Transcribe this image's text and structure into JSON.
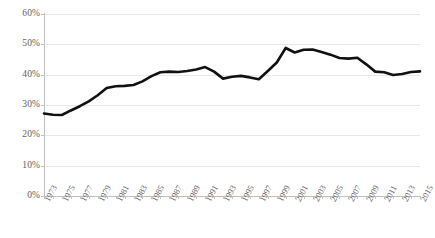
{
  "chart_data": {
    "type": "line",
    "title": "",
    "subtitle": "",
    "xlabel": "",
    "ylabel": "",
    "ylim": [
      0,
      60
    ],
    "xlim": [
      1973,
      2015
    ],
    "y_tick_labels": [
      "0%",
      "10%",
      "20%",
      "30%",
      "40%",
      "50%",
      "60%"
    ],
    "y_tick_values": [
      0,
      10,
      20,
      30,
      40,
      50,
      60
    ],
    "y_tick_suffix": "%",
    "y_tick_step": 10,
    "x_tick_labels": [
      "1973",
      "1975",
      "1977",
      "1979",
      "1981",
      "1983",
      "1985",
      "1987",
      "1989",
      "1991",
      "1993",
      "1995",
      "1997",
      "1999",
      "2001",
      "2003",
      "2005",
      "2007",
      "2009",
      "2011",
      "2013",
      "2015"
    ],
    "x_tick_step": 2,
    "x_minor_tick_step": 1,
    "grid": "horizontal",
    "legend": "none",
    "legend_position": "none",
    "line_color": "#111111",
    "grid_color": "#e8e8e8",
    "axis_color": "#bfbfbf",
    "tick_label_color": "#5f5f5f",
    "x": [
      1973,
      1974,
      1975,
      1976,
      1977,
      1978,
      1979,
      1980,
      1981,
      1982,
      1983,
      1984,
      1985,
      1986,
      1987,
      1988,
      1989,
      1990,
      1991,
      1992,
      1993,
      1994,
      1995,
      1996,
      1997,
      1998,
      1999,
      2000,
      2001,
      2002,
      2003,
      2004,
      2005,
      2006,
      2007,
      2008,
      2009,
      2010,
      2011,
      2012,
      2013,
      2014,
      2015
    ],
    "values": [
      27.2,
      26.8,
      26.7,
      28.2,
      29.6,
      31.2,
      33.2,
      35.6,
      36.2,
      36.3,
      36.6,
      37.8,
      39.5,
      40.8,
      41.0,
      40.9,
      41.2,
      41.7,
      42.5,
      41.0,
      38.7,
      39.3,
      39.6,
      39.1,
      38.5,
      41.2,
      44.0,
      48.8,
      47.3,
      48.2,
      48.3,
      47.5,
      46.6,
      45.5,
      45.3,
      45.6,
      43.4,
      41.0,
      40.8,
      39.9,
      40.2,
      40.9,
      41.1
    ],
    "series": [
      {
        "name": "series-1",
        "color": "#111111",
        "values": [
          27.2,
          26.8,
          26.7,
          28.2,
          29.6,
          31.2,
          33.2,
          35.6,
          36.2,
          36.3,
          36.6,
          37.8,
          39.5,
          40.8,
          41.0,
          40.9,
          41.2,
          41.7,
          42.5,
          41.0,
          38.7,
          39.3,
          39.6,
          39.1,
          38.5,
          41.2,
          44.0,
          48.8,
          47.3,
          48.2,
          48.3,
          47.5,
          46.6,
          45.5,
          45.3,
          45.6,
          43.4,
          41.0,
          40.8,
          39.9,
          40.2,
          40.9,
          41.1
        ]
      }
    ],
    "annotations": []
  }
}
